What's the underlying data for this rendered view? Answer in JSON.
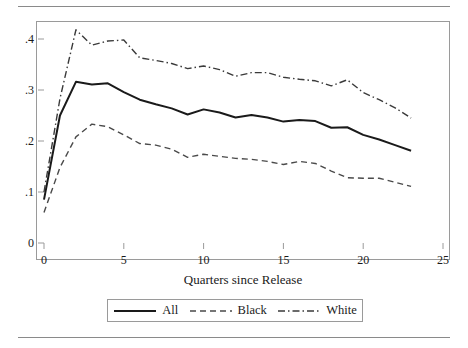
{
  "figure": {
    "has_top_rule": true,
    "has_bottom_rule": true,
    "rule_color": "#8a8a8a",
    "frame_color": "#9a9a9a"
  },
  "chart_data": {
    "type": "line",
    "title": "",
    "xlabel": "Quarters since Release",
    "ylabel": "",
    "xlim": [
      0,
      25
    ],
    "ylim": [
      0,
      0.43
    ],
    "grid": false,
    "legend_position": "bottom",
    "xticks": [
      0,
      5,
      10,
      15,
      20,
      25
    ],
    "xtick_labels": [
      "0",
      "5",
      "10",
      "15",
      "20",
      "25"
    ],
    "yticks": [
      0,
      0.1,
      0.2,
      0.3,
      0.4
    ],
    "ytick_labels": [
      "0",
      ".1",
      ".2",
      ".3",
      ".4"
    ],
    "x": [
      0,
      1,
      2,
      3,
      4,
      5,
      6,
      7,
      8,
      9,
      10,
      11,
      12,
      13,
      14,
      15,
      16,
      17,
      18,
      19,
      20,
      21,
      22,
      23
    ],
    "series": [
      {
        "name": "All",
        "style": "solid",
        "color": "#1a1a1a",
        "values": [
          0.085,
          0.25,
          0.316,
          0.311,
          0.313,
          0.296,
          0.281,
          0.272,
          0.264,
          0.252,
          0.262,
          0.256,
          0.246,
          0.251,
          0.246,
          0.238,
          0.241,
          0.239,
          0.226,
          0.227,
          0.212,
          0.203,
          0.192,
          0.181
        ]
      },
      {
        "name": "Black",
        "style": "dashed",
        "color": "#4a4a4a",
        "values": [
          0.06,
          0.148,
          0.208,
          0.233,
          0.228,
          0.212,
          0.195,
          0.192,
          0.184,
          0.168,
          0.174,
          0.17,
          0.166,
          0.164,
          0.16,
          0.154,
          0.16,
          0.156,
          0.141,
          0.128,
          0.127,
          0.127,
          0.119,
          0.111
        ]
      },
      {
        "name": "White",
        "style": "dashdot",
        "color": "#3a3a3a",
        "values": [
          0.1,
          0.283,
          0.418,
          0.388,
          0.396,
          0.398,
          0.363,
          0.358,
          0.352,
          0.342,
          0.347,
          0.34,
          0.327,
          0.334,
          0.334,
          0.325,
          0.321,
          0.318,
          0.308,
          0.32,
          0.295,
          0.281,
          0.265,
          0.245
        ]
      }
    ]
  },
  "legend": {
    "items": [
      {
        "label": "All",
        "style": "solid"
      },
      {
        "label": "Black",
        "style": "dashed"
      },
      {
        "label": "White",
        "style": "dashdot"
      }
    ]
  }
}
